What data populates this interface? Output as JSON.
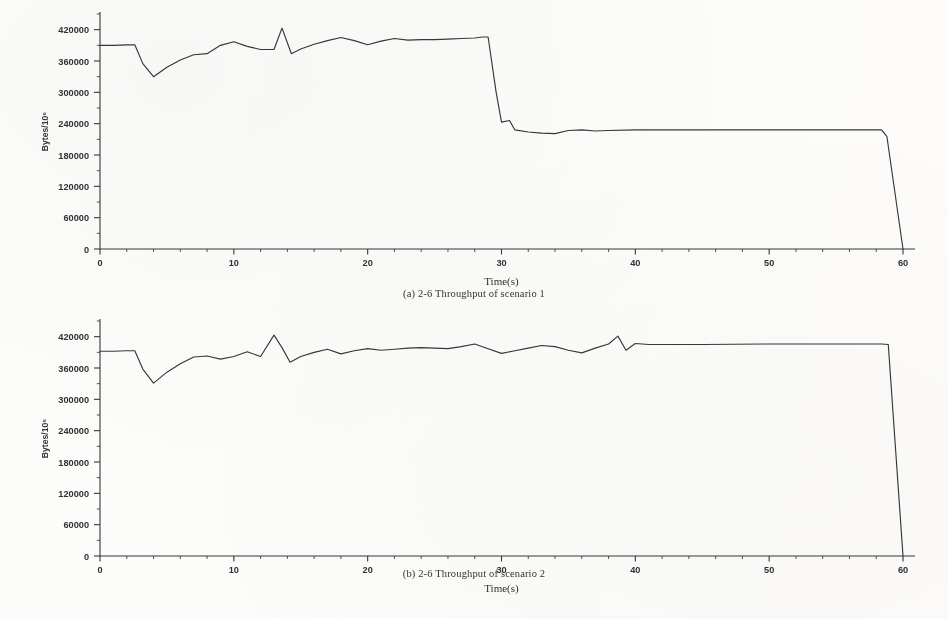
{
  "page": {
    "background_color": "#fdfdfc",
    "ink_color": "#3a3a3a"
  },
  "figures": [
    {
      "id": "figure-a",
      "caption": "(a) 2-6 Throughput  of scenario 1"
    },
    {
      "id": "figure-b",
      "caption": "(b) 2-6 Throughput  of scenario 2"
    }
  ],
  "axis": {
    "xlabel": "Time(s)",
    "ylabel": "Bytes/10⁶",
    "x_ticks": [
      "0",
      "10",
      "20",
      "30",
      "40",
      "50",
      "60"
    ],
    "y_ticks": [
      "0",
      "60000",
      "120000",
      "180000",
      "240000",
      "300000",
      "360000",
      "420000"
    ],
    "x_minor_per_major": 5,
    "y_minor_per_major": 2
  },
  "chart_data": [
    {
      "type": "line",
      "title": "(a) 2-6 Throughput  of scenario 1",
      "xlabel": "Time(s)",
      "ylabel": "Bytes/10⁶",
      "xlim": [
        0,
        60
      ],
      "ylim": [
        0,
        450000
      ],
      "xticks": [
        0,
        10,
        20,
        30,
        40,
        50,
        60
      ],
      "yticks": [
        0,
        60000,
        120000,
        180000,
        240000,
        300000,
        360000,
        420000
      ],
      "grid": false,
      "legend": "none",
      "series": [
        {
          "name": "throughput-scenario-1",
          "x": [
            0,
            1,
            2,
            2.6,
            3.2,
            4,
            5,
            6,
            7,
            8,
            9,
            10,
            11,
            12,
            13,
            13.6,
            14.3,
            15,
            16,
            17,
            18,
            19,
            20,
            21,
            22,
            23,
            24,
            25,
            26,
            27,
            28,
            28.6,
            29,
            29.6,
            30,
            30.6,
            31,
            32,
            33,
            34,
            35,
            36,
            37,
            38,
            40,
            45,
            50,
            55,
            58.4,
            58.8,
            60
          ],
          "y": [
            390000,
            390000,
            391000,
            391000,
            355000,
            330000,
            348000,
            362000,
            372000,
            374000,
            390000,
            397000,
            388000,
            382000,
            382000,
            423000,
            374000,
            383000,
            392000,
            399000,
            405000,
            399000,
            391000,
            398000,
            403000,
            400000,
            401000,
            401000,
            402000,
            403000,
            404000,
            406000,
            406000,
            300000,
            243000,
            246000,
            228000,
            224000,
            222000,
            221000,
            227000,
            228000,
            226000,
            227000,
            228000,
            228000,
            228000,
            228000,
            228000,
            215000,
            0
          ]
        }
      ]
    },
    {
      "type": "line",
      "title": "(b) 2-6 Throughput  of scenario 2",
      "xlabel": "Time(s)",
      "ylabel": "Bytes/10⁶",
      "xlim": [
        0,
        60
      ],
      "ylim": [
        0,
        450000
      ],
      "xticks": [
        0,
        10,
        20,
        30,
        40,
        50,
        60
      ],
      "yticks": [
        0,
        60000,
        120000,
        180000,
        240000,
        300000,
        360000,
        420000
      ],
      "grid": false,
      "legend": "none",
      "series": [
        {
          "name": "throughput-scenario-2",
          "x": [
            0,
            1,
            2,
            2.6,
            3.2,
            4,
            5,
            6,
            7,
            8,
            9,
            10,
            11,
            12,
            13,
            13.6,
            14.2,
            15,
            16,
            17,
            18,
            19,
            20,
            21,
            22,
            23,
            24,
            25,
            26,
            27,
            28,
            29,
            30,
            31,
            32,
            33,
            34,
            35,
            36,
            37,
            38,
            38.7,
            39.3,
            40,
            41,
            45,
            50,
            55,
            58.4,
            58.9,
            60
          ],
          "y": [
            392000,
            392000,
            393000,
            393000,
            358000,
            331000,
            352000,
            368000,
            381000,
            383000,
            377000,
            382000,
            391000,
            382000,
            423000,
            399000,
            371000,
            382000,
            390000,
            396000,
            387000,
            393000,
            397000,
            394000,
            396000,
            398000,
            399000,
            398000,
            397000,
            401000,
            406000,
            397000,
            388000,
            393000,
            398000,
            403000,
            401000,
            394000,
            389000,
            398000,
            406000,
            421000,
            394000,
            407000,
            405000,
            405000,
            406000,
            406000,
            406000,
            405000,
            0
          ]
        }
      ]
    }
  ]
}
